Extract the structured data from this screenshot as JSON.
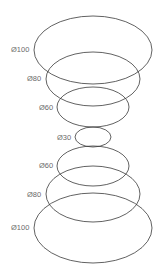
{
  "diagram": {
    "title": "",
    "stroke_color": "#3a3a3a",
    "label_color": "#6a6a6a",
    "ellipses": [
      {
        "label": "Ø100",
        "cx": 93,
        "cy": 50,
        "rx": 59,
        "ry": 34,
        "lx": 11,
        "ly": 52
      },
      {
        "label": "Ø80",
        "cx": 93,
        "cy": 79,
        "rx": 47,
        "ry": 27,
        "lx": 27,
        "ly": 81
      },
      {
        "label": "Ø60",
        "cx": 93,
        "cy": 107,
        "rx": 36,
        "ry": 20,
        "lx": 39,
        "ly": 110
      },
      {
        "label": "Ø30",
        "cx": 93,
        "cy": 137,
        "rx": 18,
        "ry": 10,
        "lx": 57,
        "ly": 140
      },
      {
        "label": "Ø60",
        "cx": 93,
        "cy": 166,
        "rx": 36,
        "ry": 20,
        "lx": 39,
        "ly": 168
      },
      {
        "label": "Ø80",
        "cx": 93,
        "cy": 194,
        "rx": 47,
        "ry": 28,
        "lx": 27,
        "ly": 197
      },
      {
        "label": "Ø100",
        "cx": 93,
        "cy": 228,
        "rx": 59,
        "ry": 35,
        "lx": 11,
        "ly": 230
      }
    ]
  }
}
